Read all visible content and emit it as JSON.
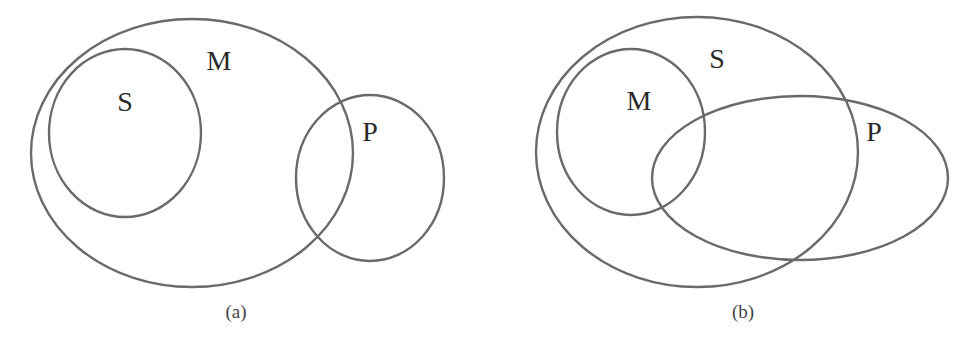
{
  "figures": [
    {
      "caption": "(a)",
      "sets": [
        {
          "label": "M",
          "shape": "ellipse",
          "cx": 192,
          "cy": 153,
          "rx": 161,
          "ry": 134,
          "label_x": 219,
          "label_y": 70
        },
        {
          "label": "S",
          "shape": "circle",
          "cx": 125,
          "cy": 133,
          "rx": 76,
          "ry": 84,
          "label_x": 125,
          "label_y": 111
        },
        {
          "label": "P",
          "shape": "circle",
          "cx": 370,
          "cy": 178,
          "rx": 74,
          "ry": 83,
          "label_x": 370,
          "label_y": 141
        }
      ],
      "relations": [
        "S inside M",
        "P partially overlaps M",
        "S and P disjoint"
      ]
    },
    {
      "caption": "(b)",
      "sets": [
        {
          "label": "S",
          "shape": "ellipse",
          "cx": 697,
          "cy": 152,
          "rx": 161,
          "ry": 135,
          "label_x": 717,
          "label_y": 68
        },
        {
          "label": "M",
          "shape": "circle",
          "cx": 631,
          "cy": 132,
          "rx": 74,
          "ry": 83,
          "label_x": 639,
          "label_y": 110
        },
        {
          "label": "P",
          "shape": "ellipse",
          "cx": 800,
          "cy": 178,
          "rx": 148,
          "ry": 82,
          "label_x": 874,
          "label_y": 141
        }
      ],
      "relations": [
        "M inside S",
        "P partially overlaps S",
        "P partially overlaps M"
      ]
    }
  ],
  "colors": {
    "stroke": "#6a6a6a",
    "text": "#2a2a2a",
    "background": "#ffffff"
  }
}
